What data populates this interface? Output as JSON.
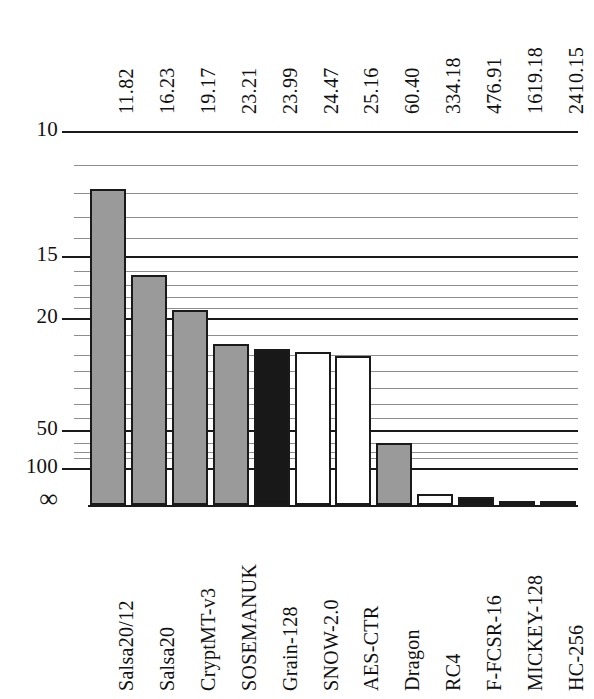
{
  "chart_data": {
    "type": "bar",
    "title": "",
    "subtitle": "",
    "xlabel": "",
    "ylabel": "",
    "orientation": "vertical",
    "grid": true,
    "legend": "none",
    "y_axis": {
      "scale": "inverse-log",
      "inverted": true,
      "tick_labels": [
        "10",
        "15",
        "20",
        "50",
        "100",
        "∞"
      ],
      "tick_values": [
        10,
        15,
        20,
        50,
        100,
        0
      ],
      "note": "smaller value = taller bar"
    },
    "categories": [
      "Salsa20/12",
      "Salsa20",
      "CryptMT-v3",
      "SOSEMANUK",
      "Grain-128",
      "SNOW-2.0",
      "AES-CTR",
      "Dragon",
      "RC4",
      "F-FCSR-16",
      "MICKEY-128",
      "HC-256"
    ],
    "values": [
      11.82,
      16.23,
      19.17,
      23.21,
      23.99,
      24.47,
      25.16,
      60.4,
      334.18,
      476.91,
      1619.18,
      2410.15
    ],
    "value_labels": [
      "11.82",
      "16.23",
      "19.17",
      "23.21",
      "23.99",
      "24.47",
      "25.16",
      "60.40",
      "334.18",
      "476.91",
      "1619.18",
      "2410.15"
    ],
    "bar_styles": [
      "gray",
      "gray",
      "gray",
      "gray",
      "black",
      "white",
      "white",
      "gray",
      "white",
      "black",
      "black",
      "black"
    ],
    "colors": {
      "gray": "#9a9a9a",
      "black": "#181818",
      "white": "#ffffff",
      "outline": "#1a1a1a",
      "gridline": "#8d8d8d",
      "gridline_major": "#1a1a1a",
      "background": "#ffffff"
    }
  }
}
